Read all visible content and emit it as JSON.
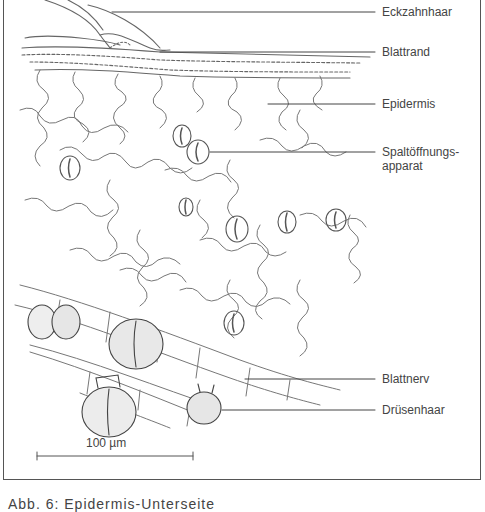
{
  "figure": {
    "labels": [
      {
        "id": "eckzahnhaar",
        "text": "Eckzahnhaar"
      },
      {
        "id": "blattrand",
        "text": "Blattrand"
      },
      {
        "id": "epidermis",
        "text": "Epidermis"
      },
      {
        "id": "spaltoeffnungsapparat",
        "text": "Spaltöffnungs-\napparat"
      },
      {
        "id": "blattnerv",
        "text": "Blattnerv"
      },
      {
        "id": "druesenhaar",
        "text": "Drüsenhaar"
      }
    ],
    "scale_bar": {
      "label": "100 µm"
    },
    "caption": "Abb. 6: Epidermis-Unterseite"
  },
  "colors": {
    "line": "#555555",
    "text": "#444444",
    "background": "#ffffff"
  }
}
